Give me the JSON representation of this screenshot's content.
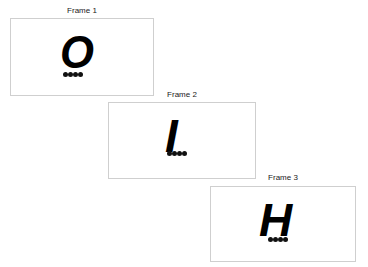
{
  "frames": [
    {
      "label": "Frame 1",
      "letter": "O"
    },
    {
      "label": "Frame 2",
      "letter": "I"
    },
    {
      "label": "Frame 3",
      "letter": "H"
    }
  ],
  "colors": {
    "border": "#cfcfcf",
    "glyph": "#000000"
  }
}
